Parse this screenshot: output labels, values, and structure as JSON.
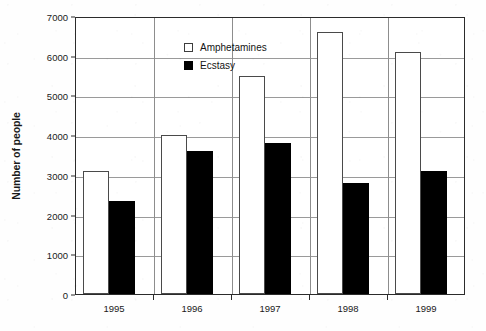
{
  "chart_data": {
    "type": "bar",
    "title": "",
    "xlabel": "",
    "ylabel": "Number of people",
    "categories": [
      "1995",
      "1996",
      "1997",
      "1998",
      "1999"
    ],
    "series": [
      {
        "name": "Amphetamines",
        "values": [
          3100,
          4000,
          5500,
          6600,
          6100
        ],
        "fill": "#ffffff",
        "stroke": "#4a4a4a"
      },
      {
        "name": "Ecstasy",
        "values": [
          2350,
          3600,
          3800,
          2800,
          3100
        ],
        "fill": "#000000",
        "stroke": "#000000"
      }
    ],
    "ylim": [
      0,
      7000
    ],
    "ytick_values": [
      0,
      1000,
      2000,
      3000,
      4000,
      5000,
      6000,
      7000
    ],
    "ytick_labels": [
      "0",
      "1000",
      "2000",
      "3000",
      "4000",
      "5000",
      "6000",
      "7000"
    ],
    "grid": true,
    "legend_position": "upper left inside plot",
    "legend_entries": [
      "Amphetamines",
      "Ecstasy"
    ]
  },
  "colors": {
    "axis": "#2b2b2b",
    "gridline": "#9a9a9a",
    "background": "#ffffff",
    "amphetamines": "#ffffff",
    "ecstasy": "#000000"
  }
}
